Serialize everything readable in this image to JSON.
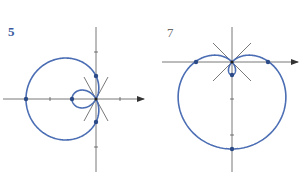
{
  "figures": [
    {
      "label": "5",
      "label_color": "#3b5a9e",
      "curve": "limacon r = a - b*cos(theta)",
      "a": 1,
      "b": 2,
      "curve_color": "#4a6db3",
      "marked_points": [
        "(-3,0)",
        "(-1,0)",
        "(0,1)",
        "(0,-1)"
      ],
      "tangent_lines_at_origin": 2,
      "x_ticks": [
        -2,
        1
      ],
      "y_ticks": [
        2,
        -2
      ]
    },
    {
      "label": "7",
      "label_color": "#6a6a6a",
      "curve": "limacon r = a - b*sin(theta)",
      "a": 1,
      "b": 1.35,
      "curve_color": "#4a6db3",
      "marked_points": [
        "(-1,0)",
        "(1,0)",
        "(0,-2.35)",
        "(0,-0.35)"
      ],
      "tangent_lines_at_origin": 2,
      "y_ticks": [
        -1,
        -2
      ]
    }
  ],
  "colors": {
    "axis": "#555555",
    "curve": "#4a6db3",
    "point": "#2c4a86"
  }
}
